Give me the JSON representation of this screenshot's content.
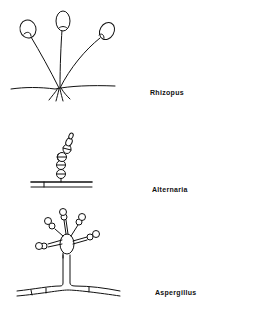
{
  "figure": {
    "organisms": [
      {
        "id": "rhizopus",
        "label": "Rhizopus"
      },
      {
        "id": "alternaria",
        "label": "Alternaria"
      },
      {
        "id": "aspergillus",
        "label": "Aspergillus"
      }
    ]
  },
  "colors": {
    "ink": "#111111",
    "background": "#ffffff"
  }
}
